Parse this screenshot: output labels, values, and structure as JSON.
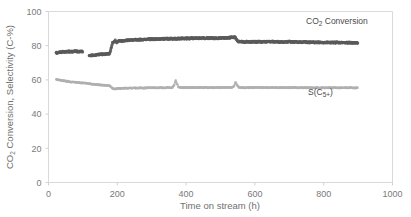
{
  "chart_data": {
    "type": "scatter",
    "title": "",
    "xlabel": "Time on stream (h)",
    "ylabel": "CO₂ Conversion, Selectivity (C-%)",
    "xlim": [
      0,
      1000
    ],
    "ylim": [
      0,
      100
    ],
    "xticks": [
      0,
      200,
      400,
      600,
      800,
      1000
    ],
    "yticks": [
      0,
      20,
      40,
      60,
      80,
      100
    ],
    "grid": false,
    "legend_position": "inside-right",
    "series": [
      {
        "name": "CO2 Conversion",
        "label": "CO₂ Conversion",
        "label_main": "CO",
        "label_sub": "2",
        "label_rest": " Conversion",
        "color": "#5a5a5a",
        "points": [
          [
            22,
            75.8
          ],
          [
            28,
            76.0
          ],
          [
            34,
            76.2
          ],
          [
            40,
            76.3
          ],
          [
            46,
            76.4
          ],
          [
            52,
            76.5
          ],
          [
            58,
            76.5
          ],
          [
            64,
            76.6
          ],
          [
            70,
            76.6
          ],
          [
            76,
            76.7
          ],
          [
            82,
            76.7
          ],
          [
            88,
            76.6
          ],
          [
            94,
            76.6
          ],
          [
            100,
            76.5
          ],
          [
            118,
            74.2
          ],
          [
            124,
            74.3
          ],
          [
            130,
            74.4
          ],
          [
            136,
            74.5
          ],
          [
            142,
            74.6
          ],
          [
            148,
            74.8
          ],
          [
            154,
            74.9
          ],
          [
            160,
            75.0
          ],
          [
            166,
            75.1
          ],
          [
            172,
            75.2
          ],
          [
            178,
            75.3
          ],
          [
            186,
            81.6
          ],
          [
            190,
            82.3
          ],
          [
            194,
            82.9
          ],
          [
            198,
            81.9
          ],
          [
            202,
            82.4
          ],
          [
            206,
            83.0
          ],
          [
            212,
            82.6
          ],
          [
            218,
            82.8
          ],
          [
            224,
            83.0
          ],
          [
            230,
            83.1
          ],
          [
            236,
            83.2
          ],
          [
            242,
            83.3
          ],
          [
            248,
            83.3
          ],
          [
            254,
            83.4
          ],
          [
            260,
            83.4
          ],
          [
            266,
            83.5
          ],
          [
            272,
            83.5
          ],
          [
            278,
            83.6
          ],
          [
            284,
            83.6
          ],
          [
            290,
            83.7
          ],
          [
            296,
            83.7
          ],
          [
            302,
            83.8
          ],
          [
            308,
            83.8
          ],
          [
            314,
            83.8
          ],
          [
            320,
            83.9
          ],
          [
            326,
            83.9
          ],
          [
            332,
            83.9
          ],
          [
            338,
            84.0
          ],
          [
            344,
            84.0
          ],
          [
            350,
            84.0
          ],
          [
            356,
            84.0
          ],
          [
            362,
            84.1
          ],
          [
            368,
            84.1
          ],
          [
            374,
            84.1
          ],
          [
            380,
            84.1
          ],
          [
            386,
            84.2
          ],
          [
            392,
            84.2
          ],
          [
            398,
            84.2
          ],
          [
            404,
            84.2
          ],
          [
            410,
            84.2
          ],
          [
            416,
            84.3
          ],
          [
            422,
            84.3
          ],
          [
            428,
            84.3
          ],
          [
            434,
            84.3
          ],
          [
            440,
            84.3
          ],
          [
            446,
            84.3
          ],
          [
            452,
            84.4
          ],
          [
            458,
            84.4
          ],
          [
            464,
            84.4
          ],
          [
            470,
            84.4
          ],
          [
            476,
            84.4
          ],
          [
            482,
            84.4
          ],
          [
            488,
            84.4
          ],
          [
            494,
            84.4
          ],
          [
            500,
            84.5
          ],
          [
            506,
            84.5
          ],
          [
            512,
            84.5
          ],
          [
            518,
            84.5
          ],
          [
            524,
            84.6
          ],
          [
            530,
            84.8
          ],
          [
            536,
            85.0
          ],
          [
            542,
            84.9
          ],
          [
            552,
            82.3
          ],
          [
            558,
            82.2
          ],
          [
            564,
            82.2
          ],
          [
            570,
            82.2
          ],
          [
            576,
            82.2
          ],
          [
            582,
            82.2
          ],
          [
            588,
            82.2
          ],
          [
            594,
            82.2
          ],
          [
            600,
            82.2
          ],
          [
            606,
            82.2
          ],
          [
            612,
            82.3
          ],
          [
            618,
            82.3
          ],
          [
            624,
            82.3
          ],
          [
            630,
            82.3
          ],
          [
            636,
            82.3
          ],
          [
            642,
            82.3
          ],
          [
            648,
            82.3
          ],
          [
            654,
            82.3
          ],
          [
            660,
            82.3
          ],
          [
            666,
            82.3
          ],
          [
            672,
            82.2
          ],
          [
            678,
            82.2
          ],
          [
            684,
            82.2
          ],
          [
            690,
            82.2
          ],
          [
            696,
            82.2
          ],
          [
            702,
            82.2
          ],
          [
            708,
            82.1
          ],
          [
            714,
            82.1
          ],
          [
            720,
            82.1
          ],
          [
            726,
            82.1
          ],
          [
            732,
            82.1
          ],
          [
            738,
            82.1
          ],
          [
            744,
            82.1
          ],
          [
            750,
            82.0
          ],
          [
            756,
            82.0
          ],
          [
            762,
            82.0
          ],
          [
            768,
            82.0
          ],
          [
            774,
            82.0
          ],
          [
            780,
            82.0
          ],
          [
            786,
            82.0
          ],
          [
            792,
            81.9
          ],
          [
            798,
            81.9
          ],
          [
            804,
            81.9
          ],
          [
            810,
            81.9
          ],
          [
            816,
            81.9
          ],
          [
            822,
            81.9
          ],
          [
            828,
            81.8
          ],
          [
            834,
            81.8
          ],
          [
            840,
            81.8
          ],
          [
            846,
            81.8
          ],
          [
            852,
            81.8
          ],
          [
            858,
            81.8
          ],
          [
            864,
            81.7
          ],
          [
            870,
            81.7
          ],
          [
            876,
            81.7
          ],
          [
            882,
            81.7
          ],
          [
            888,
            81.6
          ],
          [
            894,
            81.6
          ],
          [
            900,
            81.5
          ]
        ]
      },
      {
        "name": "S(C5+)",
        "label": "S(C₅₊)",
        "label_main": "S(C",
        "label_sub": "5+",
        "label_rest": ")",
        "color": "#b0b0b0",
        "points": [
          [
            22,
            60.2
          ],
          [
            28,
            60.0
          ],
          [
            34,
            59.8
          ],
          [
            40,
            59.6
          ],
          [
            46,
            59.4
          ],
          [
            52,
            59.2
          ],
          [
            58,
            59.0
          ],
          [
            64,
            58.8
          ],
          [
            70,
            58.7
          ],
          [
            76,
            58.6
          ],
          [
            82,
            58.5
          ],
          [
            88,
            58.4
          ],
          [
            94,
            58.3
          ],
          [
            100,
            58.2
          ],
          [
            110,
            58.0
          ],
          [
            118,
            57.8
          ],
          [
            124,
            57.6
          ],
          [
            130,
            57.4
          ],
          [
            136,
            57.3
          ],
          [
            142,
            57.2
          ],
          [
            148,
            57.1
          ],
          [
            154,
            57.0
          ],
          [
            160,
            56.9
          ],
          [
            166,
            56.8
          ],
          [
            172,
            56.7
          ],
          [
            178,
            56.6
          ],
          [
            186,
            55.0
          ],
          [
            192,
            54.8
          ],
          [
            198,
            54.9
          ],
          [
            204,
            55.0
          ],
          [
            210,
            55.0
          ],
          [
            216,
            55.1
          ],
          [
            222,
            55.1
          ],
          [
            228,
            55.1
          ],
          [
            234,
            55.2
          ],
          [
            240,
            55.2
          ],
          [
            246,
            55.2
          ],
          [
            252,
            55.2
          ],
          [
            258,
            55.3
          ],
          [
            264,
            55.3
          ],
          [
            270,
            55.3
          ],
          [
            276,
            55.3
          ],
          [
            282,
            55.3
          ],
          [
            288,
            55.4
          ],
          [
            294,
            55.4
          ],
          [
            300,
            55.4
          ],
          [
            306,
            55.4
          ],
          [
            312,
            55.4
          ],
          [
            318,
            55.4
          ],
          [
            324,
            55.4
          ],
          [
            330,
            55.4
          ],
          [
            336,
            55.4
          ],
          [
            342,
            55.4
          ],
          [
            348,
            55.5
          ],
          [
            354,
            55.5
          ],
          [
            360,
            55.5
          ],
          [
            366,
            57.2
          ],
          [
            370,
            59.8
          ],
          [
            374,
            57.5
          ],
          [
            378,
            55.6
          ],
          [
            384,
            55.5
          ],
          [
            390,
            55.5
          ],
          [
            396,
            55.5
          ],
          [
            402,
            55.5
          ],
          [
            408,
            55.5
          ],
          [
            414,
            55.5
          ],
          [
            420,
            55.5
          ],
          [
            426,
            55.5
          ],
          [
            432,
            55.5
          ],
          [
            438,
            55.5
          ],
          [
            444,
            55.5
          ],
          [
            450,
            55.5
          ],
          [
            456,
            55.5
          ],
          [
            462,
            55.5
          ],
          [
            468,
            55.5
          ],
          [
            474,
            55.5
          ],
          [
            480,
            55.5
          ],
          [
            486,
            55.5
          ],
          [
            492,
            55.5
          ],
          [
            498,
            55.5
          ],
          [
            504,
            55.5
          ],
          [
            510,
            55.5
          ],
          [
            516,
            55.5
          ],
          [
            522,
            55.5
          ],
          [
            528,
            55.5
          ],
          [
            534,
            55.6
          ],
          [
            540,
            56.5
          ],
          [
            544,
            58.8
          ],
          [
            548,
            57.0
          ],
          [
            554,
            55.6
          ],
          [
            560,
            55.5
          ],
          [
            566,
            55.5
          ],
          [
            572,
            55.5
          ],
          [
            578,
            55.5
          ],
          [
            584,
            55.5
          ],
          [
            590,
            55.5
          ],
          [
            596,
            55.5
          ],
          [
            602,
            55.5
          ],
          [
            608,
            55.5
          ],
          [
            614,
            55.5
          ],
          [
            620,
            55.5
          ],
          [
            626,
            55.5
          ],
          [
            632,
            55.5
          ],
          [
            638,
            55.5
          ],
          [
            644,
            55.5
          ],
          [
            650,
            55.5
          ],
          [
            656,
            55.5
          ],
          [
            662,
            55.5
          ],
          [
            668,
            55.5
          ],
          [
            674,
            55.5
          ],
          [
            680,
            55.5
          ],
          [
            686,
            55.5
          ],
          [
            692,
            55.5
          ],
          [
            698,
            55.5
          ],
          [
            704,
            55.5
          ],
          [
            710,
            55.5
          ],
          [
            716,
            55.5
          ],
          [
            722,
            55.4
          ],
          [
            728,
            55.4
          ],
          [
            734,
            55.4
          ],
          [
            740,
            55.4
          ],
          [
            746,
            55.4
          ],
          [
            752,
            55.4
          ],
          [
            758,
            55.4
          ],
          [
            764,
            55.4
          ],
          [
            770,
            55.4
          ],
          [
            776,
            55.4
          ],
          [
            782,
            55.4
          ],
          [
            788,
            55.4
          ],
          [
            794,
            55.4
          ],
          [
            800,
            55.4
          ],
          [
            806,
            55.4
          ],
          [
            812,
            55.4
          ],
          [
            818,
            55.4
          ],
          [
            824,
            55.4
          ],
          [
            830,
            55.4
          ],
          [
            836,
            55.4
          ],
          [
            842,
            55.4
          ],
          [
            848,
            55.4
          ],
          [
            854,
            55.4
          ],
          [
            860,
            55.4
          ],
          [
            866,
            55.4
          ],
          [
            872,
            55.4
          ],
          [
            878,
            55.4
          ],
          [
            884,
            55.3
          ],
          [
            890,
            55.3
          ],
          [
            896,
            55.3
          ],
          [
            900,
            55.3
          ]
        ]
      }
    ],
    "annotations": [
      {
        "name": "co2-conversion-legend",
        "text": "CO₂ Conversion",
        "x": 760,
        "y": 95
      },
      {
        "name": "s-c5plus-legend",
        "text": "S(C₅₊)",
        "x": 760,
        "y": 41
      }
    ]
  },
  "axes": {
    "xticks": [
      "0",
      "200",
      "400",
      "600",
      "800",
      "1000"
    ],
    "yticks": [
      "0",
      "20",
      "40",
      "60",
      "80",
      "100"
    ],
    "xlabel": "Time on stream (h)",
    "ylabel_part1": "CO",
    "ylabel_sub": "2",
    "ylabel_part2": " Conversion, Selectivity (C-%)"
  },
  "legend": {
    "series1_main": "CO",
    "series1_sub": "2",
    "series1_rest": " Conversion",
    "series2_main": "S(C",
    "series2_sub": "5+",
    "series2_rest": ")"
  },
  "colors": {
    "series1": "#5a5a5a",
    "series2": "#b0b0b0",
    "axis": "#d0d0d0",
    "text": "#7a7a7a",
    "plot_border": "#d9d9d9"
  }
}
